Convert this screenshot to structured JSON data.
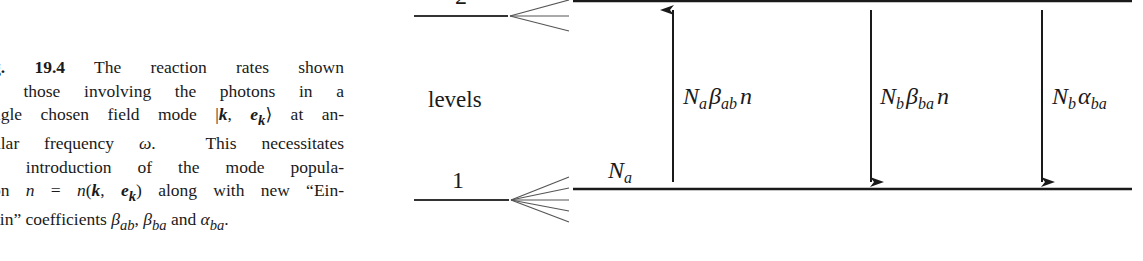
{
  "caption": {
    "fig_label": "g. 19.4",
    "lines": [
      " The reaction rates shown",
      "e those involving the photons in a",
      "ngle chosen field mode |k, e_k⟩ at an-",
      "ular frequency ω.  This necessitates",
      "e introduction of the mode popula-",
      "on n = n(k, e_k) along with new “Ein-",
      "ein” coefficients β_ab, β_ba and α_ba."
    ]
  },
  "diagram": {
    "level_labels": {
      "upper": "2",
      "lower": "1",
      "axis": "levels"
    },
    "population_label": {
      "base": "N",
      "sub": "a"
    },
    "transitions": [
      {
        "direction": "up",
        "label_parts": [
          "N",
          "a",
          "β",
          "ab",
          "n"
        ]
      },
      {
        "direction": "down",
        "label_parts": [
          "N",
          "b",
          "β",
          "ba",
          "n"
        ]
      },
      {
        "direction": "down",
        "label_parts": [
          "N",
          "b",
          "α",
          "ba",
          ""
        ]
      }
    ],
    "colors": {
      "ink": "#1a1a1a",
      "fan": "#555555"
    }
  }
}
